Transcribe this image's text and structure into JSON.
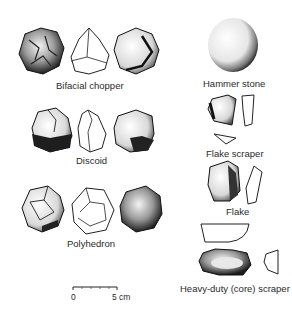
{
  "figure": {
    "tools": [
      {
        "id": "bifacial-chopper",
        "label": "Bifacial chopper"
      },
      {
        "id": "discoid",
        "label": "Discoid"
      },
      {
        "id": "polyhedron",
        "label": "Polyhedron"
      },
      {
        "id": "hammer-stone",
        "label": "Hammer stone"
      },
      {
        "id": "flake-scraper",
        "label": "Flake scraper"
      },
      {
        "id": "flake",
        "label": "Flake"
      },
      {
        "id": "heavy-duty-scraper",
        "label": "Heavy-duty (core) scraper"
      }
    ],
    "scale_bar": {
      "start": "0",
      "end": "5 cm"
    }
  }
}
